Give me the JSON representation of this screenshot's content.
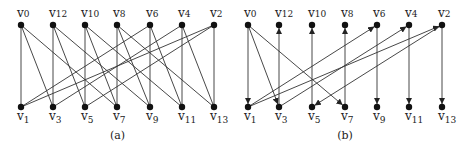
{
  "panels": [
    {
      "caption": "(a)",
      "directed": false,
      "top": [
        {
          "id": "v0",
          "x": 21
        },
        {
          "id": "v12",
          "x": 53
        },
        {
          "id": "v10",
          "x": 85
        },
        {
          "id": "v8",
          "x": 117
        },
        {
          "id": "v6",
          "x": 150
        },
        {
          "id": "v4",
          "x": 182
        },
        {
          "id": "v2",
          "x": 214
        }
      ],
      "bottom": [
        {
          "id": "v1",
          "x": 21
        },
        {
          "id": "v3",
          "x": 53
        },
        {
          "id": "v5",
          "x": 85
        },
        {
          "id": "v7",
          "x": 117
        },
        {
          "id": "v9",
          "x": 150
        },
        {
          "id": "v11",
          "x": 182
        },
        {
          "id": "v13",
          "x": 214
        }
      ],
      "edges": [
        [
          "v0",
          "v1"
        ],
        [
          "v0",
          "v3"
        ],
        [
          "v0",
          "v7"
        ],
        [
          "v12",
          "v3"
        ],
        [
          "v12",
          "v5"
        ],
        [
          "v12",
          "v9"
        ],
        [
          "v10",
          "v5"
        ],
        [
          "v10",
          "v7"
        ],
        [
          "v10",
          "v11"
        ],
        [
          "v8",
          "v7"
        ],
        [
          "v8",
          "v9"
        ],
        [
          "v8",
          "v13"
        ],
        [
          "v6",
          "v1"
        ],
        [
          "v6",
          "v9"
        ],
        [
          "v6",
          "v11"
        ],
        [
          "v4",
          "v3"
        ],
        [
          "v4",
          "v11"
        ],
        [
          "v4",
          "v13"
        ],
        [
          "v2",
          "v1"
        ],
        [
          "v2",
          "v5"
        ],
        [
          "v2",
          "v13"
        ]
      ]
    },
    {
      "caption": "(b)",
      "directed": true,
      "top": [
        {
          "id": "v0",
          "x": 248
        },
        {
          "id": "v12",
          "x": 279
        },
        {
          "id": "v10",
          "x": 312
        },
        {
          "id": "v8",
          "x": 345
        },
        {
          "id": "v6",
          "x": 377
        },
        {
          "id": "v4",
          "x": 409
        },
        {
          "id": "v2",
          "x": 442
        }
      ],
      "bottom": [
        {
          "id": "v1",
          "x": 248
        },
        {
          "id": "v3",
          "x": 279
        },
        {
          "id": "v5",
          "x": 312
        },
        {
          "id": "v7",
          "x": 345
        },
        {
          "id": "v9",
          "x": 377
        },
        {
          "id": "v11",
          "x": 409
        },
        {
          "id": "v13",
          "x": 442
        }
      ],
      "edges": [
        [
          "v0",
          "v1"
        ],
        [
          "v0",
          "v3"
        ],
        [
          "v0",
          "v7"
        ],
        [
          "v3",
          "v12"
        ],
        [
          "v5",
          "v10"
        ],
        [
          "v7",
          "v8"
        ],
        [
          "v1",
          "v6"
        ],
        [
          "v6",
          "v9"
        ],
        [
          "v3",
          "v4"
        ],
        [
          "v4",
          "v11"
        ],
        [
          "v1",
          "v2"
        ],
        [
          "v2",
          "v5"
        ],
        [
          "v2",
          "v13"
        ]
      ]
    }
  ]
}
